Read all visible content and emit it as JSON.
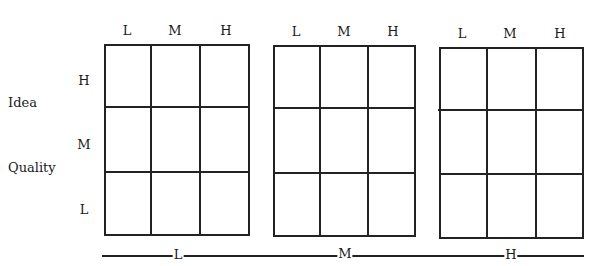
{
  "y_axis": {
    "title_line1": "Idea",
    "title_line2": "Quality",
    "levels": [
      "H",
      "M",
      "L"
    ]
  },
  "grids": [
    {
      "group_label": "L",
      "columns": [
        "L",
        "M",
        "H"
      ],
      "rows": [
        "H",
        "M",
        "L"
      ]
    },
    {
      "group_label": "M",
      "columns": [
        "L",
        "M",
        "H"
      ],
      "rows": [
        "H",
        "M",
        "L"
      ]
    },
    {
      "group_label": "H",
      "columns": [
        "L",
        "M",
        "H"
      ],
      "rows": [
        "H",
        "M",
        "L"
      ]
    }
  ],
  "bottom_axis": {
    "labels": [
      "L",
      "M",
      "H"
    ]
  },
  "colors": {
    "line": "#222222",
    "background": "#ffffff"
  }
}
